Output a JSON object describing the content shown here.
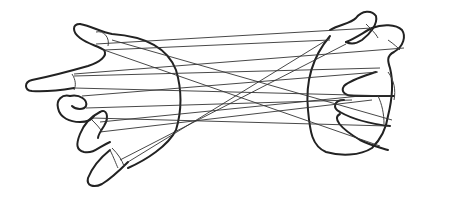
{
  "illustration": {
    "subject": "two hands holding a string figure (cat's cradle)",
    "colors": {
      "background": "#ffffff",
      "line": "#222222",
      "string": "#333333"
    }
  }
}
